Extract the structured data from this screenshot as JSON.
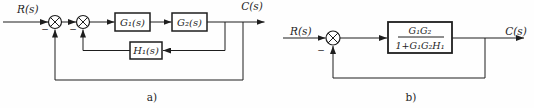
{
  "figure": {
    "ink_color": "#1e1e1e",
    "background_color": "#fefefe"
  },
  "diagram_a": {
    "caption": "a)",
    "input_label": "R(s)",
    "output_label": "C(s)",
    "sum1_sign": "−",
    "sum2_sign": "−",
    "blocks": {
      "g1": "G₁(s)",
      "g2": "G₂(s)",
      "h1": "H₁(s)"
    }
  },
  "diagram_b": {
    "caption": "b)",
    "input_label": "R(s)",
    "output_label": "C(s)",
    "sum_sign": "−",
    "transfer_block": {
      "numerator": "G₁G₂",
      "denominator": "1+G₁G₂H₁"
    }
  }
}
